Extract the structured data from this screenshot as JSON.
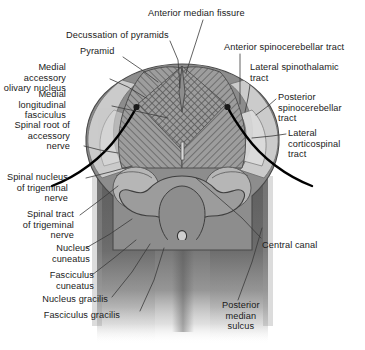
{
  "figure": {
    "width": 365,
    "height": 350,
    "background": "#ffffff",
    "text_color": "#1a1a1a",
    "leader_color": "#3a3a3a",
    "nerve_root_color": "#000000"
  },
  "palette": {
    "outline": "#4a4a4a",
    "gray_matter": "#8f8f8f",
    "white_matter_light": "#c9c9c9",
    "hatched_pyramid": "#9a9a9a",
    "olive_nucleus": "#b3b3b3",
    "cord_dark": "#6d6d6d",
    "cord_darker": "#5a5a5a",
    "specimen_mid": "#8a8a8a"
  },
  "labels": [
    {
      "id": "anterior-median-fissure",
      "text": "Anterior median fissure",
      "align": "left",
      "x": 148,
      "y": 8,
      "leader": [
        [
          203,
          20
        ],
        [
          196,
          42
        ],
        [
          186,
          73
        ]
      ]
    },
    {
      "id": "decussation-of-pyramids",
      "text": "Decussation of pyramids",
      "align": "left",
      "x": 66,
      "y": 30,
      "leader": [
        [
          170,
          41
        ],
        [
          178,
          60
        ],
        [
          180,
          88
        ]
      ]
    },
    {
      "id": "pyramid",
      "text": "Pyramid",
      "align": "left",
      "x": 80,
      "y": 46,
      "leader": [
        [
          123,
          57
        ],
        [
          142,
          70
        ],
        [
          158,
          82
        ]
      ]
    },
    {
      "id": "medial-accessory-olivary-nucleus",
      "text": "Medial accessory\nolivary nucleus",
      "align": "right",
      "x": 6,
      "y": 62,
      "leader": [
        [
          110,
          79
        ],
        [
          128,
          87
        ],
        [
          146,
          98
        ]
      ]
    },
    {
      "id": "medial-longitudinal-fasciculus",
      "text": "Medial longitudinal\nfasciculus",
      "align": "right",
      "x": 6,
      "y": 89,
      "leader": [
        [
          112,
          106
        ],
        [
          140,
          112
        ],
        [
          168,
          118
        ]
      ]
    },
    {
      "id": "spinal-root-of-accessory-nerve",
      "text": "Spinal root of\naccessory\nnerve",
      "align": "right",
      "x": 10,
      "y": 120,
      "leader": [
        [
          84,
          146
        ],
        [
          100,
          150
        ],
        [
          118,
          153
        ]
      ]
    },
    {
      "id": "spinal-nucleus-of-trigeminal-nerve",
      "text": "Spinal nucleus\nof trigeminal\nnerve",
      "align": "right",
      "x": 8,
      "y": 172,
      "leader": [
        [
          86,
          178
        ],
        [
          110,
          172
        ],
        [
          132,
          166
        ]
      ]
    },
    {
      "id": "spinal-tract-of-trigeminal-nerve",
      "text": "Spinal tract\nof trigeminal\nnerve",
      "align": "right",
      "x": 14,
      "y": 209,
      "leader": [
        [
          80,
          215
        ],
        [
          100,
          200
        ],
        [
          118,
          186
        ]
      ]
    },
    {
      "id": "nucleus-cuneatus",
      "text": "Nucleus\ncuneatus",
      "align": "right",
      "x": 30,
      "y": 243,
      "leader": [
        [
          86,
          248
        ],
        [
          110,
          234
        ],
        [
          132,
          219
        ]
      ]
    },
    {
      "id": "fasciculus-cuneatus",
      "text": "Fasciculus\ncuneatus",
      "align": "right",
      "x": 34,
      "y": 270,
      "leader": [
        [
          92,
          275
        ],
        [
          114,
          258
        ],
        [
          136,
          240
        ]
      ]
    },
    {
      "id": "nucleus-gracilis",
      "text": "Nucleus gracilis",
      "align": "right",
      "x": 48,
      "y": 294,
      "leader": [
        [
          112,
          297
        ],
        [
          132,
          272
        ],
        [
          150,
          244
        ]
      ]
    },
    {
      "id": "fasciculus-gracilis",
      "text": "Fasciculus gracilis",
      "align": "right",
      "x": 60,
      "y": 310,
      "leader": [
        [
          140,
          311
        ],
        [
          154,
          280
        ],
        [
          164,
          248
        ]
      ]
    },
    {
      "id": "anterior-spinocerebellar-tract",
      "text": "Anterior spinocerebellar tract",
      "align": "left",
      "x": 224,
      "y": 42,
      "leader": [
        [
          240,
          54
        ],
        [
          240,
          78
        ],
        [
          240,
          104
        ]
      ]
    },
    {
      "id": "lateral-spinothalamic-tract",
      "text": "Lateral spinothalamic\ntract",
      "align": "left",
      "x": 250,
      "y": 62,
      "leader": [
        [
          250,
          85
        ],
        [
          248,
          98
        ],
        [
          245,
          112
        ]
      ]
    },
    {
      "id": "posterior-spinocerebellar-tract",
      "text": "Posterior\nspinocerebellar\ntract",
      "align": "left",
      "x": 278,
      "y": 92,
      "leader": [
        [
          276,
          99
        ],
        [
          268,
          106
        ],
        [
          256,
          115
        ]
      ]
    },
    {
      "id": "lateral-corticospinal-tract",
      "text": "Lateral\ncorticospinal\ntract",
      "align": "left",
      "x": 288,
      "y": 128,
      "leader": [
        [
          286,
          134
        ],
        [
          272,
          136
        ],
        [
          252,
          138
        ]
      ]
    },
    {
      "id": "central-canal",
      "text": "Central canal",
      "align": "left",
      "x": 262,
      "y": 240,
      "leader": [
        [
          261,
          238
        ],
        [
          242,
          218
        ],
        [
          196,
          178
        ]
      ]
    },
    {
      "id": "posterior-median-sulcus",
      "text": "Posterior\nmedian\nsulcus",
      "align": "center",
      "x": 222,
      "y": 300,
      "leader": [
        [
          238,
          300
        ],
        [
          252,
          262
        ],
        [
          262,
          228
        ]
      ]
    }
  ]
}
